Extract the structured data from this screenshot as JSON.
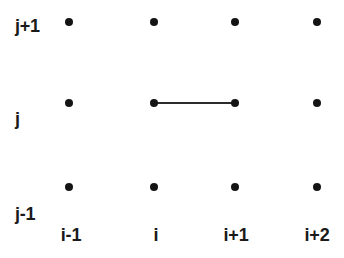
{
  "figure": {
    "background_color": "#ffffff",
    "node_color": "#141414",
    "edge_color": "#2b2b2b",
    "text_color": "#1a1a1a"
  },
  "row_labels": [
    {
      "text": "j+1",
      "x": 15,
      "y": 26
    },
    {
      "text": "j",
      "x": 15,
      "y": 119
    },
    {
      "text": "j-1",
      "x": 15,
      "y": 214
    }
  ],
  "column_labels": [
    {
      "text": "i-1",
      "x": 71,
      "y": 226
    },
    {
      "text": "i",
      "x": 156,
      "y": 226
    },
    {
      "text": "i+1",
      "x": 236,
      "y": 226
    },
    {
      "text": "i+2",
      "x": 317,
      "y": 226
    }
  ],
  "nodes": [
    {
      "name": "node-i-1-jplus1",
      "col": "i-1",
      "row": "j+1",
      "x": 69,
      "y": 22
    },
    {
      "name": "node-i-jplus1",
      "col": "i",
      "row": "j+1",
      "x": 154,
      "y": 22
    },
    {
      "name": "node-iplus1-jplus1",
      "col": "i+1",
      "row": "j+1",
      "x": 235,
      "y": 22
    },
    {
      "name": "node-iplus2-jplus1",
      "col": "i+2",
      "row": "j+1",
      "x": 317,
      "y": 22
    },
    {
      "name": "node-i-1-j",
      "col": "i-1",
      "row": "j",
      "x": 69,
      "y": 103
    },
    {
      "name": "node-i-j",
      "col": "i",
      "row": "j",
      "x": 154,
      "y": 103
    },
    {
      "name": "node-iplus1-j",
      "col": "i+1",
      "row": "j",
      "x": 235,
      "y": 103
    },
    {
      "name": "node-iplus2-j",
      "col": "i+2",
      "row": "j",
      "x": 317,
      "y": 103
    },
    {
      "name": "node-i-1-jminus1",
      "col": "i-1",
      "row": "j-1",
      "x": 69,
      "y": 187
    },
    {
      "name": "node-i-jminus1",
      "col": "i",
      "row": "j-1",
      "x": 154,
      "y": 187
    },
    {
      "name": "node-iplus1-jminus1",
      "col": "i+1",
      "row": "j-1",
      "x": 235,
      "y": 187
    },
    {
      "name": "node-iplus2-jminus1",
      "col": "i+2",
      "row": "j-1",
      "x": 317,
      "y": 187
    }
  ],
  "edges": [
    {
      "name": "edge-i-j-to-iplus1-j",
      "from": "node-i-j",
      "to": "node-iplus1-j",
      "x1": 154,
      "y1": 103,
      "x2": 235,
      "y2": 103
    }
  ],
  "chart_data": {
    "type": "scatter",
    "title": "",
    "xlabel": "",
    "ylabel": "",
    "x_tick_labels": [
      "i-1",
      "i",
      "i+1",
      "i+2"
    ],
    "y_tick_labels": [
      "j-1",
      "j",
      "j+1"
    ],
    "grid": false,
    "legend": "none",
    "points": [
      {
        "x": "i-1",
        "y": "j+1"
      },
      {
        "x": "i",
        "y": "j+1"
      },
      {
        "x": "i+1",
        "y": "j+1"
      },
      {
        "x": "i+2",
        "y": "j+1"
      },
      {
        "x": "i-1",
        "y": "j"
      },
      {
        "x": "i",
        "y": "j"
      },
      {
        "x": "i+1",
        "y": "j"
      },
      {
        "x": "i+2",
        "y": "j"
      },
      {
        "x": "i-1",
        "y": "j-1"
      },
      {
        "x": "i",
        "y": "j-1"
      },
      {
        "x": "i+1",
        "y": "j-1"
      },
      {
        "x": "i+2",
        "y": "j-1"
      }
    ],
    "connections": [
      {
        "from": {
          "x": "i",
          "y": "j"
        },
        "to": {
          "x": "i+1",
          "y": "j"
        }
      }
    ]
  }
}
